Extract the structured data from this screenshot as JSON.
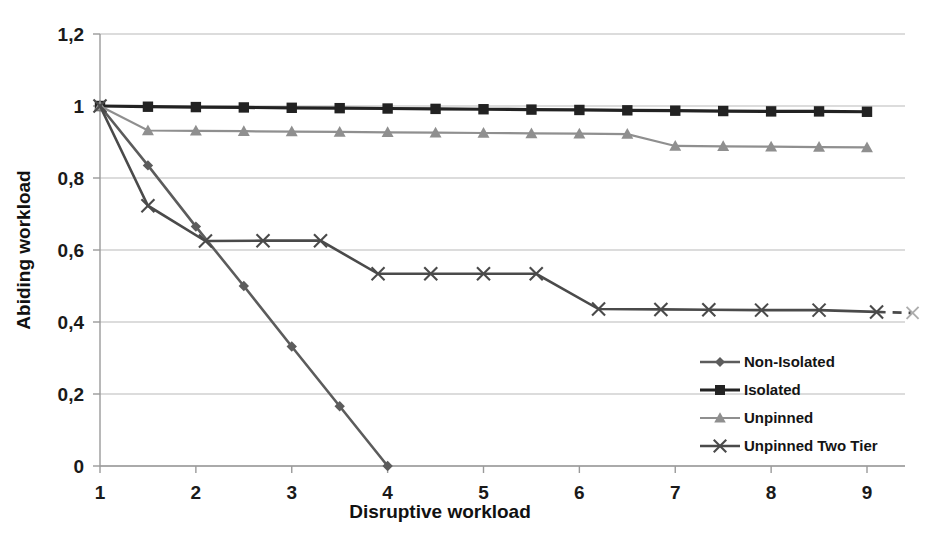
{
  "chart_data": {
    "type": "line",
    "title": "",
    "xlabel": "Disruptive workload",
    "ylabel": "Abiding workload",
    "xlim": [
      1,
      9
    ],
    "ylim": [
      0,
      1.2
    ],
    "xticks": [
      "1",
      "2",
      "3",
      "4",
      "5",
      "6",
      "7",
      "8",
      "9"
    ],
    "xtick_values": [
      1,
      2,
      3,
      4,
      5,
      6,
      7,
      8,
      9
    ],
    "yticks": [
      "0",
      "0,2",
      "0,4",
      "0,6",
      "0,8",
      "1",
      "1,2"
    ],
    "ytick_values": [
      0,
      0.2,
      0.4,
      0.6,
      0.8,
      1.0,
      1.2
    ],
    "decimal_separator": ",",
    "grid": "horizontal",
    "legend_position": "inside-right-lower",
    "x": [
      1,
      1.5,
      2,
      2.5,
      3,
      3.5,
      4,
      4.5,
      5,
      5.5,
      6,
      6.5,
      7,
      7.5,
      8,
      8.5,
      9
    ],
    "series": [
      {
        "name": "Non-Isolated",
        "marker": "diamond",
        "color": "#5c5c5c",
        "x": [
          1,
          1.5,
          2,
          2.5,
          3,
          3.5,
          4
        ],
        "values": [
          1.0,
          0.835,
          0.665,
          0.5,
          0.332,
          0.166,
          0.0
        ]
      },
      {
        "name": "Isolated",
        "marker": "square",
        "color": "#222222",
        "x": [
          1,
          1.5,
          2,
          2.5,
          3,
          3.5,
          4,
          4.5,
          5,
          5.5,
          6,
          6.5,
          7,
          7.5,
          8,
          8.5,
          9
        ],
        "values": [
          1.0,
          0.998,
          0.997,
          0.996,
          0.995,
          0.994,
          0.993,
          0.992,
          0.991,
          0.99,
          0.989,
          0.988,
          0.987,
          0.986,
          0.985,
          0.985,
          0.984
        ]
      },
      {
        "name": "Unpinned",
        "marker": "triangle",
        "color": "#8f8f8f",
        "x": [
          1,
          1.5,
          2,
          2.5,
          3,
          3.5,
          4,
          4.5,
          5,
          5.5,
          6,
          6.5,
          7,
          7.5,
          8,
          8.5,
          9
        ],
        "values": [
          1.0,
          0.932,
          0.931,
          0.93,
          0.929,
          0.928,
          0.927,
          0.926,
          0.925,
          0.924,
          0.923,
          0.922,
          0.889,
          0.888,
          0.887,
          0.886,
          0.885
        ]
      },
      {
        "name": "Unpinned Two Tier",
        "marker": "x",
        "color": "#4a4a4a",
        "x": [
          1,
          1.5,
          2.1,
          2.7,
          3.3,
          3.9,
          4.45,
          5.0,
          5.55,
          6.2,
          6.85,
          7.35,
          7.9,
          8.5,
          9.1
        ],
        "values": [
          1.0,
          0.723,
          0.625,
          0.626,
          0.626,
          0.534,
          0.534,
          0.534,
          0.534,
          0.436,
          0.435,
          0.434,
          0.433,
          0.433,
          0.428
        ],
        "trailing_dashed": true
      }
    ]
  },
  "legend": {
    "entries": [
      {
        "label": "Non-Isolated"
      },
      {
        "label": "Isolated"
      },
      {
        "label": "Unpinned"
      },
      {
        "label": "Unpinned Two Tier"
      }
    ]
  }
}
